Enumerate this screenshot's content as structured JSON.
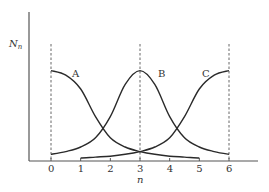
{
  "chart_data": {
    "type": "line",
    "title": "",
    "xlabel": "n",
    "ylabel": "N_n",
    "xlim": [
      0,
      6
    ],
    "x_ticks": [
      "0",
      "1",
      "2",
      "3",
      "4",
      "5",
      "6"
    ],
    "y_ticks": [],
    "grid": false,
    "legend": "none (curves labeled inline)",
    "vertical_dashed_lines": [
      0,
      3,
      6
    ],
    "series": [
      {
        "name": "A",
        "label_pos": [
          0.8,
          0.9
        ],
        "x": [
          0,
          0.5,
          1,
          1.5,
          2,
          2.5,
          3,
          3.5,
          4,
          4.5,
          5
        ],
        "y": [
          0.95,
          0.9,
          0.75,
          0.45,
          0.22,
          0.12,
          0.07,
          0.04,
          0.02,
          0.01,
          0.0
        ]
      },
      {
        "name": "B",
        "label_pos": [
          3.6,
          0.9
        ],
        "x": [
          0,
          0.5,
          1,
          1.5,
          2,
          2.5,
          3,
          3.5,
          4,
          4.5,
          5,
          5.5,
          6
        ],
        "y": [
          0.04,
          0.07,
          0.12,
          0.22,
          0.45,
          0.8,
          0.95,
          0.8,
          0.45,
          0.22,
          0.12,
          0.07,
          0.04
        ]
      },
      {
        "name": "C",
        "label_pos": [
          5.0,
          0.8
        ],
        "x": [
          1,
          1.5,
          2,
          2.5,
          3,
          3.5,
          4,
          4.5,
          5,
          5.5,
          6
        ],
        "y": [
          0.0,
          0.01,
          0.02,
          0.04,
          0.07,
          0.12,
          0.22,
          0.45,
          0.75,
          0.9,
          0.95
        ]
      }
    ]
  },
  "labels": {
    "y_axis": "N",
    "y_axis_sub": "n",
    "x_axis": "n",
    "ticks": [
      "0",
      "1",
      "2",
      "3",
      "4",
      "5",
      "6"
    ],
    "curve_a": "A",
    "curve_b": "B",
    "curve_c": "C"
  }
}
